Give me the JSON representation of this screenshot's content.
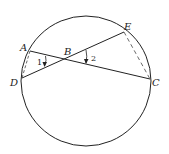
{
  "diagram": {
    "circle": {
      "cx": 86,
      "cy": 81,
      "r": 65
    },
    "points": {
      "A": {
        "label": "A",
        "x": 30,
        "y": 51
      },
      "B": {
        "label": "B",
        "x": 66,
        "y": 60
      },
      "C": {
        "label": "C",
        "x": 150,
        "y": 79
      },
      "D": {
        "label": "D",
        "x": 22,
        "y": 78
      },
      "E": {
        "label": "E",
        "x": 124,
        "y": 32
      }
    },
    "segments": [
      {
        "from": "A",
        "to": "C",
        "style": "solid"
      },
      {
        "from": "D",
        "to": "E",
        "style": "solid"
      },
      {
        "from": "A",
        "to": "D",
        "style": "dashed"
      },
      {
        "from": "E",
        "to": "C",
        "style": "dashed"
      }
    ],
    "angles": [
      {
        "label": "1",
        "at": "B",
        "between": [
          "A",
          "D"
        ]
      },
      {
        "label": "2",
        "at": "B",
        "between": [
          "E",
          "C"
        ]
      }
    ]
  }
}
